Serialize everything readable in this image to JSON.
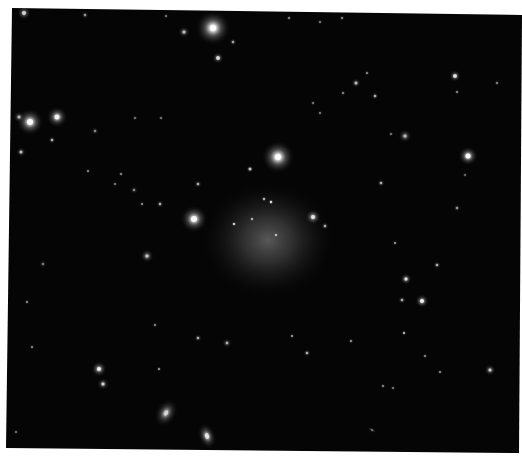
{
  "image": {
    "description": "Deep-field astronomical image of a galaxy cluster with diffuse intracluster light",
    "width": 522,
    "height": 461,
    "background_page": "#ffffff",
    "sky_color": "#050505",
    "frame_polygon": [
      [
        12,
        8
      ],
      [
        522,
        15
      ],
      [
        519,
        453
      ],
      [
        6,
        448
      ]
    ],
    "diffuse_halo": {
      "cx": 268,
      "cy": 240,
      "rx": 68,
      "ry": 60,
      "peak": 0.55
    },
    "sources": [
      {
        "x": 213,
        "y": 28,
        "r": 18,
        "core": 3.0,
        "b": 1.0
      },
      {
        "x": 218,
        "y": 58,
        "r": 6,
        "core": 2.0,
        "b": 0.7
      },
      {
        "x": 184,
        "y": 32,
        "r": 6,
        "core": 1.5,
        "b": 0.55
      },
      {
        "x": 233,
        "y": 42,
        "r": 4,
        "core": 1.2,
        "b": 0.45
      },
      {
        "x": 24,
        "y": 13,
        "r": 7,
        "core": 2.0,
        "b": 0.65
      },
      {
        "x": 85,
        "y": 15,
        "r": 4,
        "core": 1.2,
        "b": 0.4
      },
      {
        "x": 30,
        "y": 122,
        "r": 14,
        "core": 3.0,
        "b": 0.95
      },
      {
        "x": 57,
        "y": 117,
        "r": 11,
        "core": 2.5,
        "b": 0.85
      },
      {
        "x": 19,
        "y": 117,
        "r": 6,
        "core": 1.5,
        "b": 0.5
      },
      {
        "x": 52,
        "y": 140,
        "r": 4,
        "core": 1.2,
        "b": 0.5
      },
      {
        "x": 21,
        "y": 152,
        "r": 5,
        "core": 1.5,
        "b": 0.55
      },
      {
        "x": 278,
        "y": 157,
        "r": 17,
        "core": 3.0,
        "b": 1.0
      },
      {
        "x": 194,
        "y": 219,
        "r": 14,
        "core": 3.0,
        "b": 0.95
      },
      {
        "x": 313,
        "y": 217,
        "r": 8,
        "core": 2.0,
        "b": 0.75
      },
      {
        "x": 325,
        "y": 226,
        "r": 4,
        "core": 1.2,
        "b": 0.5
      },
      {
        "x": 250,
        "y": 169,
        "r": 4,
        "core": 1.5,
        "b": 0.6
      },
      {
        "x": 198,
        "y": 184,
        "r": 4,
        "core": 1.2,
        "b": 0.5
      },
      {
        "x": 264,
        "y": 199,
        "r": 3,
        "core": 1.2,
        "b": 0.55
      },
      {
        "x": 271,
        "y": 202,
        "r": 3,
        "core": 1.2,
        "b": 0.75
      },
      {
        "x": 234,
        "y": 224,
        "r": 3,
        "core": 1.0,
        "b": 0.75
      },
      {
        "x": 252,
        "y": 219,
        "r": 3,
        "core": 1.0,
        "b": 0.55
      },
      {
        "x": 276,
        "y": 235,
        "r": 3,
        "core": 1.0,
        "b": 0.6
      },
      {
        "x": 468,
        "y": 156,
        "r": 10,
        "core": 2.5,
        "b": 0.95
      },
      {
        "x": 405,
        "y": 136,
        "r": 7,
        "core": 1.5,
        "b": 0.55
      },
      {
        "x": 455,
        "y": 76,
        "r": 6,
        "core": 2.0,
        "b": 0.75
      },
      {
        "x": 457,
        "y": 92,
        "r": 3,
        "core": 1.0,
        "b": 0.4
      },
      {
        "x": 497,
        "y": 83,
        "r": 3,
        "core": 1.0,
        "b": 0.4
      },
      {
        "x": 356,
        "y": 83,
        "r": 5,
        "core": 1.5,
        "b": 0.55
      },
      {
        "x": 367,
        "y": 73,
        "r": 3,
        "core": 1.0,
        "b": 0.4
      },
      {
        "x": 375,
        "y": 96,
        "r": 4,
        "core": 1.2,
        "b": 0.5
      },
      {
        "x": 343,
        "y": 93,
        "r": 3,
        "core": 1.0,
        "b": 0.4
      },
      {
        "x": 313,
        "y": 103,
        "r": 3,
        "core": 1.0,
        "b": 0.35
      },
      {
        "x": 320,
        "y": 113,
        "r": 3,
        "core": 1.0,
        "b": 0.35
      },
      {
        "x": 391,
        "y": 134,
        "r": 3,
        "core": 1.0,
        "b": 0.35
      },
      {
        "x": 381,
        "y": 183,
        "r": 4,
        "core": 1.2,
        "b": 0.5
      },
      {
        "x": 457,
        "y": 208,
        "r": 4,
        "core": 1.2,
        "b": 0.4
      },
      {
        "x": 289,
        "y": 18,
        "r": 3,
        "core": 1.0,
        "b": 0.4
      },
      {
        "x": 342,
        "y": 18,
        "r": 3,
        "core": 1.0,
        "b": 0.4
      },
      {
        "x": 320,
        "y": 22,
        "r": 3,
        "core": 1.0,
        "b": 0.35
      },
      {
        "x": 166,
        "y": 16,
        "r": 3,
        "core": 1.0,
        "b": 0.35
      },
      {
        "x": 135,
        "y": 118,
        "r": 3,
        "core": 1.0,
        "b": 0.35
      },
      {
        "x": 161,
        "y": 118,
        "r": 3,
        "core": 1.0,
        "b": 0.35
      },
      {
        "x": 95,
        "y": 131,
        "r": 4,
        "core": 1.0,
        "b": 0.4
      },
      {
        "x": 88,
        "y": 171,
        "r": 3,
        "core": 1.0,
        "b": 0.4
      },
      {
        "x": 121,
        "y": 174,
        "r": 3,
        "core": 1.0,
        "b": 0.4
      },
      {
        "x": 115,
        "y": 184,
        "r": 3,
        "core": 1.0,
        "b": 0.35
      },
      {
        "x": 134,
        "y": 190,
        "r": 4,
        "core": 1.0,
        "b": 0.4
      },
      {
        "x": 142,
        "y": 204,
        "r": 3,
        "core": 1.0,
        "b": 0.4
      },
      {
        "x": 160,
        "y": 204,
        "r": 4,
        "core": 1.2,
        "b": 0.5
      },
      {
        "x": 147,
        "y": 256,
        "r": 7,
        "core": 1.5,
        "b": 0.6
      },
      {
        "x": 43,
        "y": 264,
        "r": 4,
        "core": 1.0,
        "b": 0.35
      },
      {
        "x": 27,
        "y": 302,
        "r": 3,
        "core": 1.0,
        "b": 0.4
      },
      {
        "x": 155,
        "y": 325,
        "r": 3,
        "core": 1.0,
        "b": 0.4
      },
      {
        "x": 198,
        "y": 338,
        "r": 4,
        "core": 1.2,
        "b": 0.5
      },
      {
        "x": 227,
        "y": 343,
        "r": 5,
        "core": 1.2,
        "b": 0.5
      },
      {
        "x": 32,
        "y": 347,
        "r": 3,
        "core": 1.0,
        "b": 0.4
      },
      {
        "x": 99,
        "y": 369,
        "r": 8,
        "core": 2.0,
        "b": 0.8
      },
      {
        "x": 103,
        "y": 384,
        "r": 6,
        "core": 1.5,
        "b": 0.65
      },
      {
        "x": 159,
        "y": 369,
        "r": 3,
        "core": 1.0,
        "b": 0.45
      },
      {
        "x": 166,
        "y": 413,
        "r": 11,
        "core": 2.0,
        "b": 0.65,
        "ry_scale": 1.4,
        "rot": 30
      },
      {
        "x": 207,
        "y": 436,
        "r": 9,
        "core": 2.0,
        "b": 0.75,
        "ry_scale": 1.5,
        "rot": -20
      },
      {
        "x": 16,
        "y": 432,
        "r": 3,
        "core": 1.0,
        "b": 0.35
      },
      {
        "x": 406,
        "y": 279,
        "r": 6,
        "core": 1.5,
        "b": 0.75
      },
      {
        "x": 422,
        "y": 301,
        "r": 7,
        "core": 2.0,
        "b": 0.85
      },
      {
        "x": 402,
        "y": 300,
        "r": 4,
        "core": 1.2,
        "b": 0.5
      },
      {
        "x": 437,
        "y": 265,
        "r": 4,
        "core": 1.2,
        "b": 0.5
      },
      {
        "x": 395,
        "y": 243,
        "r": 3,
        "core": 1.0,
        "b": 0.45
      },
      {
        "x": 404,
        "y": 333,
        "r": 3,
        "core": 1.2,
        "b": 0.5
      },
      {
        "x": 292,
        "y": 336,
        "r": 3,
        "core": 1.0,
        "b": 0.45
      },
      {
        "x": 351,
        "y": 341,
        "r": 3,
        "core": 1.0,
        "b": 0.45
      },
      {
        "x": 307,
        "y": 353,
        "r": 4,
        "core": 1.2,
        "b": 0.5
      },
      {
        "x": 425,
        "y": 356,
        "r": 3,
        "core": 1.0,
        "b": 0.4
      },
      {
        "x": 440,
        "y": 372,
        "r": 3,
        "core": 1.0,
        "b": 0.4
      },
      {
        "x": 490,
        "y": 370,
        "r": 6,
        "core": 1.5,
        "b": 0.6
      },
      {
        "x": 383,
        "y": 386,
        "r": 3,
        "core": 1.0,
        "b": 0.4
      },
      {
        "x": 393,
        "y": 388,
        "r": 3,
        "core": 1.0,
        "b": 0.35
      },
      {
        "x": 372,
        "y": 430,
        "r": 5,
        "core": 1.0,
        "b": 0.4,
        "ry_scale": 0.5,
        "rot": 30
      },
      {
        "x": 465,
        "y": 175,
        "r": 3,
        "core": 1.0,
        "b": 0.3
      }
    ]
  }
}
